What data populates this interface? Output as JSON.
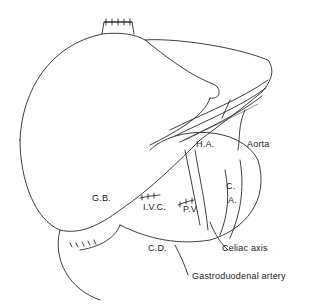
{
  "figure": {
    "labels": {
      "ha": "H.A.",
      "aorta": "Aorta",
      "ca": "C.\nA.",
      "ca_line1": "C.",
      "ca_line2": "A.",
      "gb": "G.B.",
      "ivc": "I.V.C.",
      "pv": "P.V.",
      "cd": "C.D.",
      "celiac": "Celiac axis",
      "gastroduodenal": "Gastroduodenal artery"
    },
    "colors": {
      "line": "#2a2a2a",
      "background": "#ffffff"
    }
  }
}
